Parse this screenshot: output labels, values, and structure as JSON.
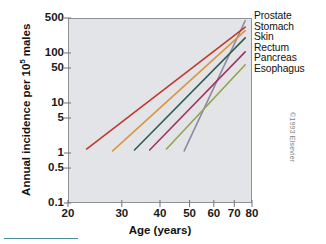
{
  "chart_data": {
    "type": "line",
    "title": "",
    "xlabel": "Age (years)",
    "ylabel": "Annual incidence per 10⁵ males",
    "ylabel_main": "Annual incidence per 10",
    "ylabel_exp": "5",
    "ylabel_tail": " males",
    "xscale": "log",
    "yscale": "log",
    "xlim": [
      20,
      80
    ],
    "ylim": [
      0.1,
      500
    ],
    "grid": false,
    "legend_position": "right",
    "xticks": [
      20,
      30,
      40,
      50,
      60,
      70,
      80
    ],
    "xtick_labels": [
      "20",
      "30",
      "40",
      "50",
      "60",
      "70",
      "80"
    ],
    "yticks": [
      0.1,
      0.5,
      1,
      5,
      10,
      50,
      100,
      500
    ],
    "ytick_labels": [
      "0.1",
      "0.5",
      "1",
      "5",
      "10",
      "50",
      "100",
      "500"
    ],
    "series": [
      {
        "name": "Prostate",
        "color": "#8c8a9e",
        "points": [
          [
            48,
            1.1
          ],
          [
            76,
            440
          ]
        ]
      },
      {
        "name": "Stomach",
        "color": "#c0392b",
        "points": [
          [
            23,
            1.2
          ],
          [
            76,
            330
          ]
        ]
      },
      {
        "name": "Skin",
        "color": "#d99640",
        "points": [
          [
            28,
            1.1
          ],
          [
            76,
            280
          ]
        ]
      },
      {
        "name": "Rectum",
        "color": "#2f5d4e",
        "points": [
          [
            33,
            1.15
          ],
          [
            76,
            200
          ]
        ]
      },
      {
        "name": "Pancreas",
        "color": "#a03560",
        "points": [
          [
            37,
            1.15
          ],
          [
            76,
            105
          ]
        ]
      },
      {
        "name": "Esophagus",
        "color": "#9aa04b",
        "points": [
          [
            42,
            1.2
          ],
          [
            76,
            58
          ]
        ]
      }
    ]
  },
  "legend": {
    "items": [
      "Prostate",
      "Stomach",
      "Skin",
      "Rectum",
      "Pancreas",
      "Esophagus"
    ]
  },
  "footer": {
    "copyright": "©1993 Elsevier"
  }
}
